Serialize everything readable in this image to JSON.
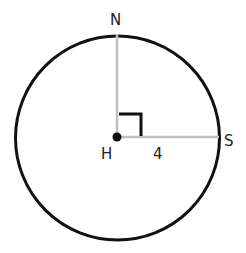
{
  "diagram": {
    "title": "",
    "colors": {
      "circle": "#111111",
      "radius_lines": "#c0c0c0",
      "right_angle_marker": "#111111",
      "center_point": "#111111",
      "labels": "#222222"
    },
    "circle": {
      "center_label": "H",
      "center": [
        117,
        137
      ],
      "radius": 102
    },
    "points": [
      {
        "label": "N",
        "position": "top"
      },
      {
        "label": "S",
        "position": "right"
      },
      {
        "label": "H",
        "position": "center"
      }
    ],
    "segments": [
      {
        "from": "H",
        "to": "N",
        "label": ""
      },
      {
        "from": "H",
        "to": "S",
        "label": "4"
      }
    ],
    "angle_marker": {
      "vertex": "H",
      "type": "right-angle",
      "between": [
        "HN",
        "HS"
      ]
    },
    "labels": {
      "N": "N",
      "S": "S",
      "H": "H",
      "radius_length": "4"
    }
  }
}
